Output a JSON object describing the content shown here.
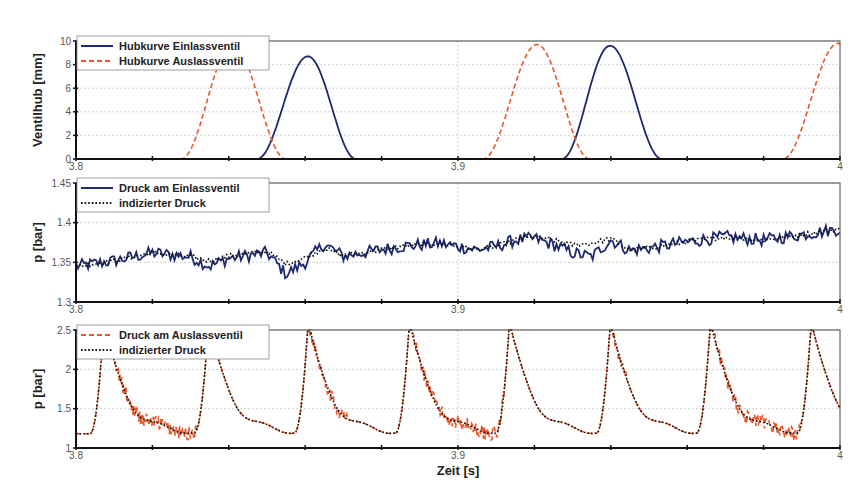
{
  "chart_data": [
    {
      "id": "valve-lift",
      "type": "line",
      "title": "",
      "xlabel": "",
      "ylabel": "Ventilhub [mm]",
      "xlim": [
        3.8,
        4.0
      ],
      "ylim": [
        0,
        10
      ],
      "yticks": [
        0,
        2,
        4,
        6,
        8,
        10
      ],
      "ytick_labels": [
        "0",
        "2",
        "4",
        "6",
        "8",
        "10"
      ],
      "xticks": [
        3.8,
        3.9,
        4.0
      ],
      "xtick_labels": [
        "3.8",
        "3.9",
        "4"
      ],
      "x_minor_step": 0.02,
      "grid": true,
      "legend_position": "top-left",
      "series": [
        {
          "name": "Hubkurve Einlassventil",
          "color": "#1f2a6e",
          "style": "solid",
          "lobes": [
            {
              "start": 3.8474,
              "peak_x": 3.8607,
              "end": 3.8733,
              "peak": 8.7
            },
            {
              "start": 3.9272,
              "peak_x": 3.9398,
              "end": 3.9534,
              "peak": 9.6
            }
          ]
        },
        {
          "name": "Hubkurve Auslassventil",
          "color": "#e8582a",
          "style": "dashed",
          "lobes": [
            {
              "start": 3.8275,
              "peak_x": 3.841,
              "end": 3.855,
              "peak": 9.7
            },
            {
              "start": 3.9065,
              "peak_x": 3.9207,
              "end": 3.9345,
              "peak": 9.7
            },
            {
              "start": 3.985,
              "peak_x": 3.9995,
              "end": 4.014,
              "peak": 9.8
            }
          ]
        }
      ]
    },
    {
      "id": "intake-pressure",
      "type": "line",
      "title": "",
      "xlabel": "",
      "ylabel": "p [bar]",
      "xlim": [
        3.8,
        4.0
      ],
      "ylim": [
        1.3,
        1.45
      ],
      "yticks": [
        1.3,
        1.35,
        1.4,
        1.45
      ],
      "ytick_labels": [
        "1.3",
        "1.35",
        "1.4",
        "1.45"
      ],
      "xticks": [
        3.8,
        3.9,
        4.0
      ],
      "xtick_labels": [
        "3.8",
        "3.9",
        "4"
      ],
      "x_minor_step": 0.02,
      "grid": true,
      "legend_position": "top-left",
      "series": [
        {
          "name": "Druck am Einlassventil",
          "color": "#1f2a6e",
          "style": "solid",
          "noise_amplitude": 0.008,
          "x": [
            3.8,
            3.81,
            3.82,
            3.83,
            3.835,
            3.84,
            3.85,
            3.855,
            3.86,
            3.865,
            3.87,
            3.875,
            3.88,
            3.885,
            3.89,
            3.895,
            3.9,
            3.905,
            3.91,
            3.915,
            3.92,
            3.925,
            3.93,
            3.935,
            3.94,
            3.945,
            3.95,
            3.96,
            3.97,
            3.98,
            3.99,
            4.0
          ],
          "y": [
            1.345,
            1.352,
            1.362,
            1.357,
            1.345,
            1.355,
            1.362,
            1.335,
            1.35,
            1.373,
            1.358,
            1.362,
            1.366,
            1.37,
            1.372,
            1.374,
            1.37,
            1.366,
            1.37,
            1.378,
            1.38,
            1.372,
            1.362,
            1.357,
            1.378,
            1.365,
            1.368,
            1.376,
            1.382,
            1.378,
            1.385,
            1.392
          ]
        },
        {
          "name": "indizierter Druck",
          "color": "#111111",
          "style": "dotted",
          "x": [
            3.8,
            3.81,
            3.82,
            3.83,
            3.835,
            3.84,
            3.85,
            3.855,
            3.86,
            3.865,
            3.87,
            3.875,
            3.88,
            3.885,
            3.89,
            3.895,
            3.9,
            3.905,
            3.91,
            3.915,
            3.92,
            3.925,
            3.93,
            3.935,
            3.94,
            3.945,
            3.95,
            3.96,
            3.97,
            3.98,
            3.99,
            4.0
          ],
          "y": [
            1.345,
            1.352,
            1.362,
            1.357,
            1.352,
            1.358,
            1.364,
            1.348,
            1.356,
            1.368,
            1.358,
            1.362,
            1.366,
            1.37,
            1.372,
            1.374,
            1.37,
            1.366,
            1.37,
            1.378,
            1.382,
            1.378,
            1.372,
            1.374,
            1.38,
            1.365,
            1.368,
            1.376,
            1.382,
            1.378,
            1.385,
            1.392
          ]
        }
      ]
    },
    {
      "id": "exhaust-pressure",
      "type": "line",
      "title": "",
      "xlabel": "Zeit [s]",
      "ylabel": "p [bar]",
      "xlim": [
        3.8,
        4.0
      ],
      "ylim": [
        1,
        2.5
      ],
      "yticks": [
        1,
        1.5,
        2,
        2.5
      ],
      "ytick_labels": [
        "1",
        "1.5",
        "2",
        "2.5"
      ],
      "xticks": [
        3.8,
        3.9,
        4.0
      ],
      "xtick_labels": [
        "3.8",
        "3.9",
        "4"
      ],
      "x_minor_step": 0.02,
      "grid": true,
      "legend_position": "top-left",
      "pulse_period": 0.0264,
      "pulse_peaks_x": [
        3.8072,
        3.8346,
        3.8607,
        3.8872,
        3.9134,
        3.9398,
        3.966,
        3.9924
      ],
      "pulse_peak_value": 2.55,
      "trough_value": 1.1,
      "series": [
        {
          "name": "Druck am Auslassventil",
          "color": "#e8582a",
          "style": "dashed",
          "noisy_windows": [
            [
              3.808,
              3.832
            ],
            [
              3.861,
              3.871
            ],
            [
              3.887,
              3.912
            ],
            [
              3.94,
              3.944
            ],
            [
              3.967,
              3.99
            ]
          ],
          "noise_amplitude": 0.09
        },
        {
          "name": "indizierter Druck",
          "color": "#111111",
          "style": "dotted"
        }
      ]
    }
  ]
}
